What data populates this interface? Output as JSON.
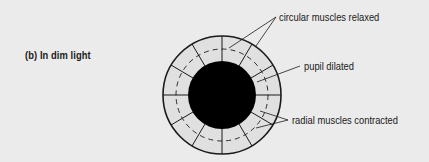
{
  "figure": {
    "caption": "(b) In dim light",
    "labels": {
      "circular_muscles": "circular muscles relaxed",
      "pupil": "pupil dilated",
      "radial_muscles": "radial muscles contracted"
    },
    "colors": {
      "background": "#ebebeb",
      "iris_fill": "#e0e0e0",
      "pupil_fill": "#000000",
      "line": "#1a1a1a"
    }
  }
}
